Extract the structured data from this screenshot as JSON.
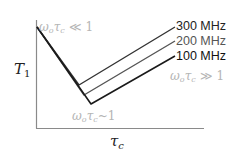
{
  "chart_data": {
    "type": "line",
    "title": "",
    "xlabel": "τ_c",
    "ylabel": "T_1",
    "xlabel_main": "τ",
    "xlabel_sub": "c",
    "ylabel_main": "T",
    "ylabel_sub": "1",
    "grid": false,
    "legend_position": "inline-right",
    "series": [
      {
        "name": "300 MHz",
        "color": "#333333",
        "points": [
          [
            37,
            27
          ],
          [
            79,
            85
          ],
          [
            175,
            27
          ]
        ]
      },
      {
        "name": "200 MHz",
        "color": "#555555",
        "points": [
          [
            37,
            27
          ],
          [
            84,
            95
          ],
          [
            175,
            41
          ]
        ]
      },
      {
        "name": "100 MHz",
        "color": "#1a1a1a",
        "points": [
          [
            37,
            27
          ],
          [
            91,
            104
          ],
          [
            175,
            56
          ]
        ]
      }
    ],
    "annotations": [
      {
        "text": "ω₀τc ≪ 1",
        "region": "short correlation time (top-left)",
        "color": "#b0b0b0"
      },
      {
        "text": "ω₀τc ~1",
        "region": "T1 minimum",
        "color": "#b0b0b0"
      },
      {
        "text": "ω₀τc ≫ 1",
        "region": "long correlation time (right)",
        "color": "#b0b0b0"
      }
    ]
  },
  "labels": {
    "series_300": "300 MHz",
    "series_200": "200 MHz",
    "series_100": "100 MHz",
    "annot_low": {
      "omega": "ω",
      "o": "o",
      "tau": "τ",
      "c": "c",
      "rel": " ≪ 1"
    },
    "annot_min": {
      "omega": "ω",
      "o": "o",
      "tau": "τ",
      "c": "c",
      "rel": "~1"
    },
    "annot_high": {
      "omega": "ω",
      "o": "o",
      "tau": "τ",
      "c": "c",
      "rel": " ≫ 1"
    }
  }
}
